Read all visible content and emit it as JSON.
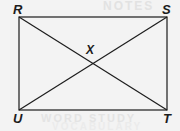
{
  "figure": {
    "shape_type": "rectangle-with-diagonals",
    "background_color": "#f3f3f3",
    "line_color": "#1c1c1c",
    "labels": {
      "top_left": "R",
      "top_right": "S",
      "bottom_right": "T",
      "bottom_left": "U",
      "center": "X"
    },
    "geometry": {
      "rect": {
        "left": 19,
        "top": 17,
        "right": 167,
        "bottom": 110
      },
      "vertices": {
        "R": {
          "x": 19,
          "y": 17
        },
        "S": {
          "x": 167,
          "y": 17
        },
        "T": {
          "x": 167,
          "y": 110
        },
        "U": {
          "x": 19,
          "y": 110
        }
      },
      "diagonals": [
        {
          "name": "R-T",
          "from": "R",
          "to": "T"
        },
        {
          "name": "S-U",
          "from": "S",
          "to": "U"
        }
      ],
      "intersection": {
        "label": "X",
        "x": 93,
        "y": 63.5
      }
    },
    "ghost_text": {
      "top": "NOTES",
      "bottom": "WORD STUDY",
      "bottom2": "VOCABULARY"
    }
  }
}
